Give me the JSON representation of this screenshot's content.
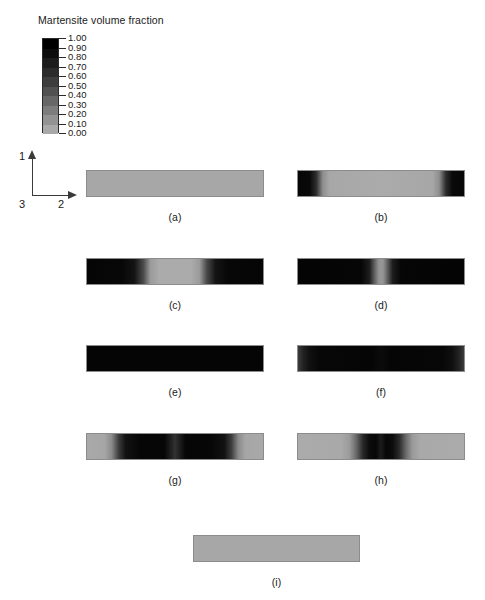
{
  "legend": {
    "title": "Martensite volume fraction",
    "ticks": [
      "1.00",
      "0.90",
      "0.80",
      "0.70",
      "0.60",
      "0.50",
      "0.40",
      "0.30",
      "0.20",
      "0.10",
      "0.00"
    ],
    "band_colors": [
      "#000000",
      "#0d0d0d",
      "#1c1c1c",
      "#2b2b2b",
      "#3d3d3d",
      "#515151",
      "#676767",
      "#7d7d7d",
      "#939393",
      "#a9a9a9"
    ],
    "max_value": 1.0,
    "min_value": 0.0
  },
  "axes": {
    "vertical_label": "1",
    "horizontal_label": "2",
    "origin_label": "3"
  },
  "chart_data": {
    "type": "heatmap",
    "title": "Martensite volume fraction",
    "colorbar_label": "Martensite volume fraction",
    "colormap": "grayscale-inverted",
    "vmin": 0.0,
    "vmax": 1.0,
    "axis_labels": {
      "vertical": "1",
      "horizontal": "2",
      "out_of_plane": "3"
    },
    "panels": [
      {
        "id": "a",
        "caption": "(a)",
        "description": "Uniform low martensite fraction across entire specimen",
        "profile_values": [
          0.02,
          0.02,
          0.02,
          0.02,
          0.02,
          0.02,
          0.02,
          0.02,
          0.02
        ],
        "gradient": "linear-gradient(to right, #a7a7a7 0%, #a7a7a7 100%)"
      },
      {
        "id": "b",
        "caption": "(b)",
        "description": "Fully transformed dark bands at both ends, untransformed light centre",
        "profile_values": [
          1.0,
          0.95,
          0.25,
          0.05,
          0.03,
          0.05,
          0.25,
          0.95,
          1.0
        ],
        "gradient": "linear-gradient(to right, #060606 0%, #090909 7%, #2e2e2e 11%, #8f8f8f 15%, #a7a7a7 19%, #ababab 50%, #a7a7a7 81%, #8f8f8f 85%, #2e2e2e 89%, #090909 93%, #060606 100%)"
      },
      {
        "id": "c",
        "caption": "(c)",
        "description": "Transformation fronts propagated inward; light elliptical region remains at centre",
        "profile_values": [
          1.0,
          1.0,
          0.9,
          0.3,
          0.05,
          0.3,
          0.9,
          1.0,
          1.0
        ],
        "gradient": "linear-gradient(to right, #050505 0%, #070707 20%, #141414 27%, #4a4a4a 32%, #9a9a9a 36%, #ababab 41%, #ababab 59%, #9a9a9a 64%, #4a4a4a 68%, #141414 73%, #070707 80%, #050505 100%)"
      },
      {
        "id": "d",
        "caption": "(d)",
        "description": "Nearly complete transformation; small light untransformed blob at centre",
        "profile_values": [
          1.0,
          1.0,
          1.0,
          0.85,
          0.25,
          0.85,
          1.0,
          1.0,
          1.0
        ],
        "gradient": "linear-gradient(to right, #040404 0%, #060606 38%, #1d1d1d 43%, #5e5e5e 46%, #909090 48.5%, #989898 50%, #909090 51.5%, #5e5e5e 54%, #1d1d1d 57%, #060606 62%, #040404 100%)"
      },
      {
        "id": "e",
        "caption": "(e)",
        "description": "Fully transformed specimen, uniform maximum martensite fraction",
        "profile_values": [
          1.0,
          1.0,
          1.0,
          1.0,
          1.0,
          1.0,
          1.0,
          1.0,
          1.0
        ],
        "gradient": "linear-gradient(to right, #050505 0%, #050505 100%)"
      },
      {
        "id": "f",
        "caption": "(f)",
        "description": "Reverse transformation beginning; slight lightening at both ends",
        "profile_values": [
          0.78,
          0.9,
          0.98,
          1.0,
          0.97,
          1.0,
          0.98,
          0.9,
          0.78
        ],
        "gradient": "linear-gradient(to right, #3c3c3c 0%, #232323 3%, #101010 7%, #070707 13%, #050505 44%, #0b0b0b 50%, #050505 56%, #070707 87%, #101010 93%, #232323 97%, #3c3c3c 100%)"
      },
      {
        "id": "g",
        "caption": "(g)",
        "description": "Reverse transformation from ends; light regions at both ends, dark band in centre",
        "profile_values": [
          0.05,
          0.15,
          0.85,
          1.0,
          0.8,
          1.0,
          0.85,
          0.15,
          0.05
        ],
        "gradient": "linear-gradient(to right, #a9a9a9 0%, #a6a6a6 10%, #8a8a8a 14%, #3c3c3c 18%, #121212 22%, #060606 30%, #060606 44%, #2a2a2a 49%, #333333 50%, #2a2a2a 51%, #060606 56%, #060606 70%, #121212 78%, #3c3c3c 82%, #8a8a8a 86%, #a6a6a6 90%, #a9a9a9 100%)"
      },
      {
        "id": "h",
        "caption": "(h)",
        "description": "Mostly reverted; narrow dark martensite band remains near centre",
        "profile_values": [
          0.05,
          0.05,
          0.1,
          0.75,
          0.95,
          0.75,
          0.1,
          0.05,
          0.05
        ],
        "gradient": "linear-gradient(to right, #ababab 0%, #a9a9a9 26%, #9b9b9b 31%, #6a6a6a 35%, #2a2a2a 39%, #0c0c0c 43%, #070707 47%, #1c1c1c 50%, #070707 53%, #0c0c0c 57%, #2a2a2a 61%, #6a6a6a 65%, #9b9b9b 69%, #a9a9a9 74%, #ababab 100%)"
      },
      {
        "id": "i",
        "caption": "(i)",
        "description": "Fully reverted specimen, uniform low martensite fraction",
        "profile_values": [
          0.02,
          0.02,
          0.02,
          0.02,
          0.02,
          0.02,
          0.02,
          0.02,
          0.02
        ],
        "gradient": "linear-gradient(to right, #a7a7a7 0%, #a7a7a7 100%)"
      }
    ]
  }
}
